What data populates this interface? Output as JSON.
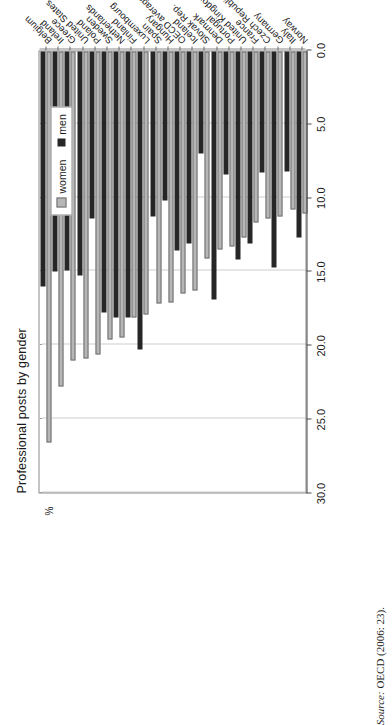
{
  "figure": {
    "title": "Professional posts by gender",
    "unit_label": "%",
    "source_prefix": "Source:",
    "source_text": "OECD (2006: 23)."
  },
  "legend": {
    "position": "top-left",
    "entries": [
      {
        "label": "women",
        "color": "#b6b6b6"
      },
      {
        "label": "men",
        "color": "#262626"
      }
    ]
  },
  "chart_data": {
    "type": "bar",
    "orientation": "horizontal",
    "title": "Professional posts by gender",
    "xlabel": "",
    "ylabel": "%",
    "ylim": [
      0.0,
      30.0
    ],
    "tick_labels": [
      "0.0",
      "5.0",
      "10.0",
      "15.0",
      "20.0",
      "25.0",
      "30.0"
    ],
    "ticks": [
      0.0,
      5.0,
      10.0,
      15.0,
      20.0,
      25.0,
      30.0
    ],
    "grid": true,
    "legend_position": "top-left",
    "categories": [
      "Norway",
      "Italy",
      "Germany",
      "Czech Republic",
      "France",
      "United Kingdom",
      "Portugal",
      "Denmark",
      "Slovak Rep.",
      "Iceland",
      "OECD average",
      "Hungary",
      "Spain",
      "Luxembourg",
      "Finland",
      "Netherlands",
      "Sweden",
      "Poland",
      "United States",
      "Greece",
      "Ireland",
      "Belgium"
    ],
    "series": [
      {
        "name": "women",
        "color": "#b6b6b6",
        "values": [
          11.0,
          10.7,
          11.2,
          11.3,
          11.6,
          12.6,
          13.2,
          13.4,
          14.0,
          16.2,
          16.4,
          17.0,
          17.1,
          17.8,
          18.0,
          19.4,
          19.5,
          20.5,
          20.8,
          20.9,
          22.7,
          26.5
        ]
      },
      {
        "name": "men",
        "color": "#262626",
        "values": [
          12.6,
          8.1,
          14.6,
          8.2,
          13.0,
          14.1,
          8.3,
          16.8,
          6.9,
          13.0,
          13.5,
          10.1,
          11.2,
          20.2,
          18.0,
          18.0,
          17.7,
          11.3,
          15.2,
          14.8,
          14.9,
          15.9
        ]
      }
    ]
  }
}
